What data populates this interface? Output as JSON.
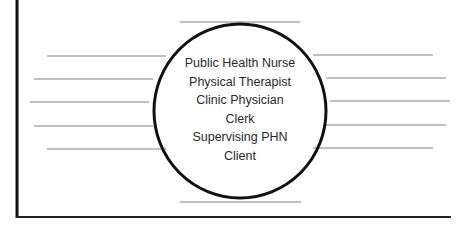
{
  "diagram": {
    "type": "hub-and-spoke worksheet",
    "center": {
      "roles": [
        "Public Health Nurse",
        "Physical Therapist",
        "Clinic Physician",
        "Clerk",
        "Supervising PHN",
        "Client"
      ]
    },
    "blank_lines": {
      "top": 1,
      "bottom": 1,
      "left": 5,
      "right": 5
    },
    "colors": {
      "border": "#111111",
      "circle": "#111111",
      "blank_line": "#808080",
      "text": "#2a2a2a",
      "background": "#ffffff"
    }
  }
}
